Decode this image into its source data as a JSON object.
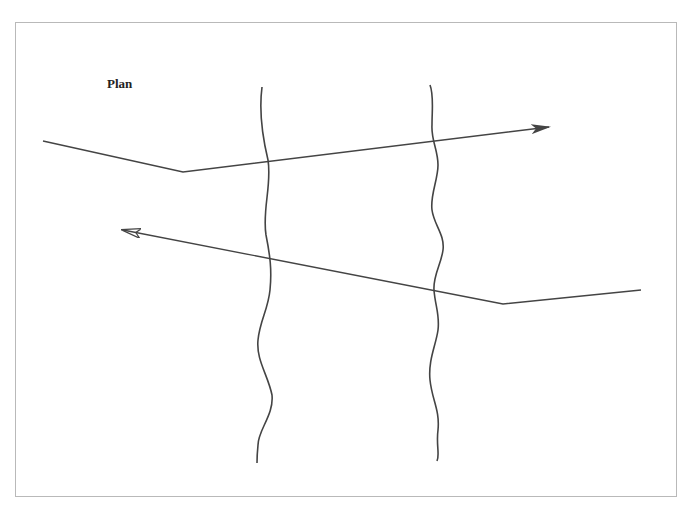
{
  "diagram": {
    "title": "Plan",
    "stroke_color": "#444444",
    "frame_color": "#b9b9b9",
    "paths": [
      {
        "name": "outbound-path",
        "direction": "right",
        "points": [
          [
            43,
            141
          ],
          [
            183,
            172
          ],
          [
            549,
            127
          ]
        ]
      },
      {
        "name": "return-path",
        "direction": "left",
        "points": [
          [
            641,
            290
          ],
          [
            503,
            304
          ],
          [
            123,
            230
          ]
        ]
      }
    ],
    "boundaries": [
      {
        "name": "left-wavy-boundary"
      },
      {
        "name": "right-wavy-boundary"
      }
    ]
  }
}
